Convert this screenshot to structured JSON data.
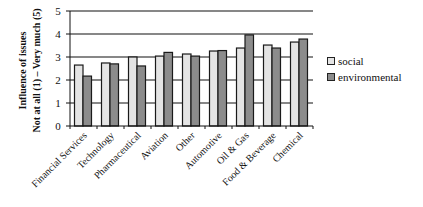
{
  "chart_data": {
    "type": "bar",
    "title": "",
    "xlabel": "",
    "ylabel": "Influence of issues\nNot at all (1) – Very much (5)",
    "ylabel_lines": [
      "Influence of issues",
      "Not at all (1) – Very much (5)"
    ],
    "ylim": [
      0,
      5
    ],
    "yticks": [
      0,
      1,
      2,
      3,
      4,
      5
    ],
    "grid": true,
    "legend_position": "right",
    "categories": [
      "Financial Services",
      "Technology",
      "Pharmaceutical",
      "Aviation",
      "Other",
      "Automotive",
      "Oil & Gas",
      "Food & Beverage",
      "Chemical"
    ],
    "series": [
      {
        "name": "social",
        "color": "#e4e4e4",
        "values": [
          2.65,
          2.74,
          3.0,
          3.04,
          3.13,
          3.26,
          3.39,
          3.52,
          3.65
        ]
      },
      {
        "name": "environmental",
        "color": "#8c8c8c",
        "values": [
          2.17,
          2.7,
          2.61,
          3.2,
          3.04,
          3.28,
          3.96,
          3.39,
          3.78
        ]
      }
    ]
  }
}
